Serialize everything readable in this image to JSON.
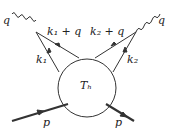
{
  "diagram": {
    "type": "feynman-diagram",
    "labels": {
      "photon_left": "q",
      "photon_right": "q",
      "k1_plus_q": "k₁ + q",
      "k2_plus_q": "k₂ + q",
      "k1": "k₁",
      "k2": "k₂",
      "blob": "Tₕ",
      "p_in": "p",
      "p_out": "p"
    },
    "colors": {
      "line": "#333333",
      "background": "#ffffff"
    }
  }
}
